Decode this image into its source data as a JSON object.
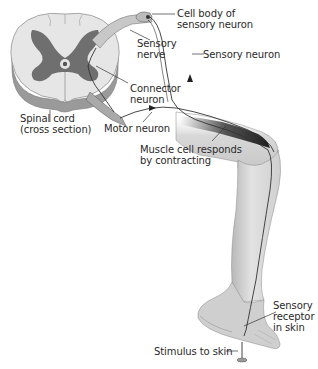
{
  "figure": {
    "colors": {
      "white_matter": "#e6e6e6",
      "gray_matter": "#6f6f6f",
      "cord_edge": "#8a8a8a",
      "leg_fill": "#dcdcdc",
      "leg_shade": "#a8a8a8",
      "muscle": "#3a3a3a",
      "text": "#2a2a2a",
      "line": "#333333"
    }
  },
  "labels": {
    "cell_body": "Cell body of\nsensory neuron",
    "sensory_nerve": "Sensory\nnerve",
    "sensory_neuron": "Sensory neuron",
    "connector_neuron": "Connector\nneuron",
    "spinal_cord": "Spinal cord\n(cross section)",
    "motor_neuron": "Motor neuron",
    "muscle_cell": "Muscle cell responds\nby contracting",
    "sensory_receptor": "Sensory\nreceptor\nin skin",
    "stimulus": "Stimulus to skin"
  }
}
